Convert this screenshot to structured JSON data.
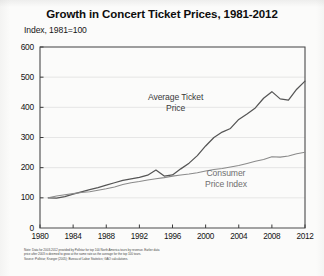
{
  "chart_data": {
    "type": "line",
    "title": "Growth in Concert Ticket Prices, 1981-2012",
    "subtitle": "Index, 1981=100",
    "xlabel": "",
    "ylabel": "",
    "ylim": [
      0,
      600
    ],
    "xlim": [
      1980,
      2012
    ],
    "yticks": [
      0,
      100,
      200,
      300,
      400,
      500,
      600
    ],
    "xticks": [
      1980,
      1984,
      1988,
      1992,
      1996,
      2000,
      2004,
      2008,
      2012
    ],
    "grid": "horizontal",
    "legend_position": "inline-labels",
    "series": [
      {
        "name": "Average Ticket Price",
        "label_line1": "Average Ticket",
        "label_line2": "Price",
        "color": "#555555",
        "x": [
          1981,
          1982,
          1983,
          1984,
          1985,
          1986,
          1987,
          1988,
          1989,
          1990,
          1991,
          1992,
          1993,
          1994,
          1995,
          1996,
          1997,
          1998,
          1999,
          2000,
          2001,
          2002,
          2003,
          2004,
          2005,
          2006,
          2007,
          2008,
          2009,
          2010,
          2011,
          2012
        ],
        "values": [
          100,
          99,
          104,
          112,
          120,
          127,
          134,
          142,
          150,
          158,
          163,
          168,
          175,
          192,
          172,
          176,
          196,
          215,
          240,
          272,
          300,
          318,
          330,
          360,
          378,
          398,
          430,
          452,
          428,
          424,
          460,
          487
        ]
      },
      {
        "name": "Consumer Price Index",
        "label_line1": "Consumer",
        "label_line2": "Price Index",
        "color": "#8a8a8a",
        "x": [
          1981,
          1982,
          1983,
          1984,
          1985,
          1986,
          1987,
          1988,
          1989,
          1990,
          1991,
          1992,
          1993,
          1994,
          1995,
          1996,
          1997,
          1998,
          1999,
          2000,
          2001,
          2002,
          2003,
          2004,
          2005,
          2006,
          2007,
          2008,
          2009,
          2010,
          2011,
          2012
        ],
        "values": [
          100,
          106,
          110,
          114,
          118,
          120,
          125,
          130,
          136,
          144,
          150,
          154,
          159,
          163,
          167,
          172,
          176,
          179,
          183,
          189,
          194,
          197,
          202,
          207,
          214,
          221,
          227,
          236,
          235,
          239,
          246,
          251
        ]
      }
    ],
    "note_line1": "Note: Data for 2003-2012 provided by Pollstar for top 100 North America tours by revenue. Earlier data",
    "note_line2": "price after 2003 is deemed to grow at the same rate as the average for the top 100 tours.",
    "note_line3": "Source: Pollstar; Krueger (2005); Bureau of Labor Statistics; GAO calculations."
  }
}
